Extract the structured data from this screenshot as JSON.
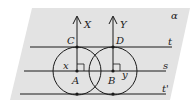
{
  "diagram": {
    "plane_label": "α",
    "lines": [
      {
        "name": "t",
        "label": "t"
      },
      {
        "name": "s",
        "label": "s"
      },
      {
        "name": "t-prime",
        "label": "t'"
      }
    ],
    "points": {
      "A": "A",
      "B": "B",
      "C": "C",
      "D": "D"
    },
    "axes": {
      "X": "X",
      "Y": "Y"
    },
    "radii": {
      "x": "x",
      "y": "y"
    },
    "colors": {
      "plane": "#e3e3e3",
      "stroke": "#1a1a1a",
      "background": "#ffffff"
    }
  }
}
